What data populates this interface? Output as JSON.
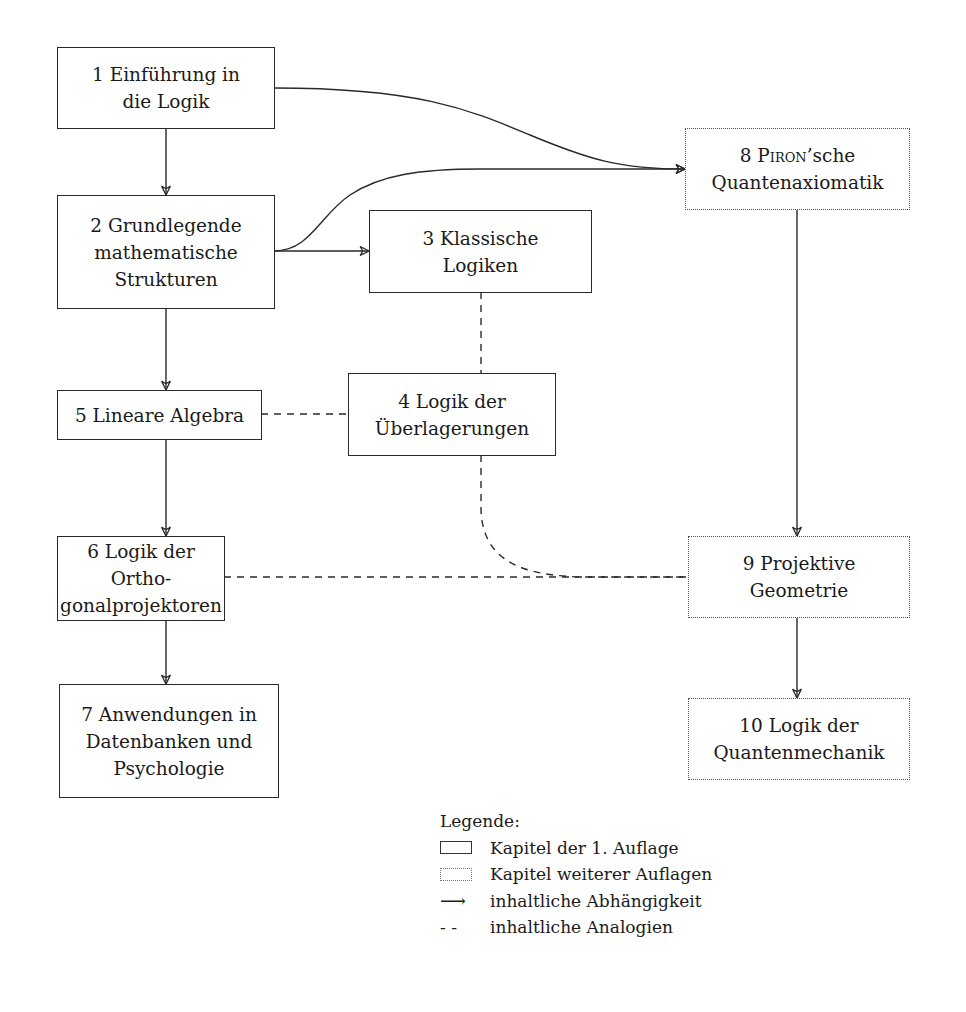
{
  "diagram": {
    "nodes": [
      {
        "id": "1",
        "label": "1 Einführung in\ndie Logik",
        "style": "solid"
      },
      {
        "id": "2",
        "label": "2 Grundlegende\nmathematische\nStrukturen",
        "style": "solid"
      },
      {
        "id": "3",
        "label": "3 Klassische\nLogiken",
        "style": "solid"
      },
      {
        "id": "4",
        "label": "4 Logik der\nÜberlagerungen",
        "style": "solid"
      },
      {
        "id": "5",
        "label": "5 Lineare Algebra",
        "style": "solid"
      },
      {
        "id": "6",
        "label": "6 Logik der Ortho-\ngonalprojektoren",
        "style": "solid"
      },
      {
        "id": "7",
        "label": "7 Anwendungen in\nDatenbanken und\nPsychologie",
        "style": "solid"
      },
      {
        "id": "8",
        "label_prefix": "8 ",
        "label_smallcaps": "Piron",
        "label_suffix": "’sche\nQuantenaxiomatik",
        "style": "dotted"
      },
      {
        "id": "9",
        "label": "9 Projektive\nGeometrie",
        "style": "dotted"
      },
      {
        "id": "10",
        "label": "10 Logik der\nQuantenmechanik",
        "style": "dotted"
      }
    ],
    "edges": [
      {
        "from": "1",
        "to": "2",
        "type": "dependency"
      },
      {
        "from": "1",
        "to": "8",
        "type": "dependency"
      },
      {
        "from": "2",
        "to": "8",
        "type": "dependency"
      },
      {
        "from": "2",
        "to": "3",
        "type": "dependency"
      },
      {
        "from": "2",
        "to": "5",
        "type": "dependency"
      },
      {
        "from": "5",
        "to": "6",
        "type": "dependency"
      },
      {
        "from": "6",
        "to": "7",
        "type": "dependency"
      },
      {
        "from": "8",
        "to": "9",
        "type": "dependency"
      },
      {
        "from": "9",
        "to": "10",
        "type": "dependency"
      },
      {
        "from": "3",
        "to": "4",
        "type": "analogy"
      },
      {
        "from": "5",
        "to": "4",
        "type": "analogy"
      },
      {
        "from": "6",
        "to": "9",
        "type": "analogy"
      },
      {
        "from": "4",
        "to": "9",
        "type": "analogy"
      }
    ]
  },
  "legend": {
    "title": "Legende:",
    "items": [
      {
        "icon": "solid-box-icon",
        "label": "Kapitel der 1. Auflage"
      },
      {
        "icon": "dotted-box-icon",
        "label": "Kapitel weiterer Auflagen"
      },
      {
        "icon": "arrow-icon",
        "glyph": "⟶",
        "label": "inhaltliche Abhängigkeit"
      },
      {
        "icon": "dashed-line-icon",
        "glyph": "- -",
        "label": "inhaltliche Analogien"
      }
    ]
  }
}
